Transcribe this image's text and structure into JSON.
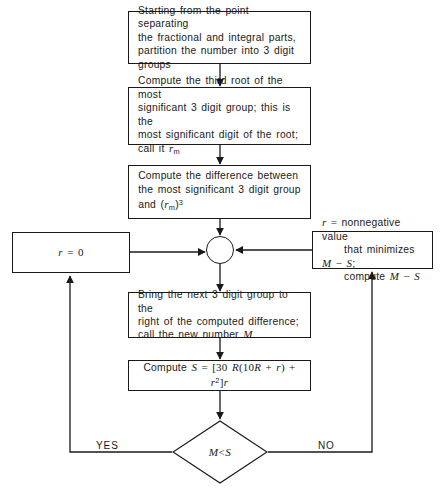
{
  "diagram": {
    "stroke_color": "#1a1a1a",
    "background_color": "#ffffff",
    "nodes": {
      "partition": {
        "shape": "process",
        "text": "Starting from the point separating\nthe fractional and integral parts,\npartition the number into 3 digit\ngroups"
      },
      "third_root": {
        "shape": "process",
        "line1": "Compute the third root of the most",
        "line2": "significant 3 digit group; this is the",
        "line3": "most significant digit of the root;",
        "line4_prefix": "call it ",
        "line4_var": "r",
        "line4_sub": "m"
      },
      "difference": {
        "shape": "process",
        "line1": "Compute the difference between",
        "line2": "the most significant 3 digit group",
        "line3_prefix": "and (",
        "line3_var": "r",
        "line3_sub": "m",
        "line3_mid": ")",
        "line3_sup": "3"
      },
      "r_zero": {
        "shape": "process",
        "var": "r",
        "eq": " = ",
        "value": "0"
      },
      "r_nonnegative": {
        "shape": "process",
        "line1_var": "r",
        "line1_eq": " = ",
        "line1_text": "nonnegative value",
        "line2_text": "that minimizes ",
        "line2_m": "M",
        "line2_minus": " − ",
        "line2_s": "S",
        "line2_semi": ";",
        "line3_text": "compute  ",
        "line3_m": "M",
        "line3_minus": " − ",
        "line3_s": "S"
      },
      "bring_next": {
        "shape": "process",
        "line1": "Bring the next 3 digit group to the",
        "line2": "right of the computed difference;",
        "line3_prefix": "call the new number ",
        "line3_var": "M"
      },
      "compute_s": {
        "shape": "process",
        "prefix": "Compute ",
        "s": "S",
        "eq": " = ",
        "expr_open": "[30 ",
        "expr_r1": "R",
        "expr_paren_open": "(10",
        "expr_r2": "R",
        "expr_plus1": " + ",
        "expr_r3": "r",
        "expr_paren_close": ")",
        "expr_plus2": " + ",
        "expr_r4": "r",
        "expr_sup": "2",
        "expr_close": "]",
        "expr_r5": "r"
      },
      "junction": {
        "shape": "connector",
        "label": ""
      },
      "decision": {
        "shape": "diamond",
        "m": "M",
        "op": " < ",
        "s": "S"
      }
    },
    "edge_labels": {
      "yes": "YES",
      "no": "NO"
    }
  }
}
